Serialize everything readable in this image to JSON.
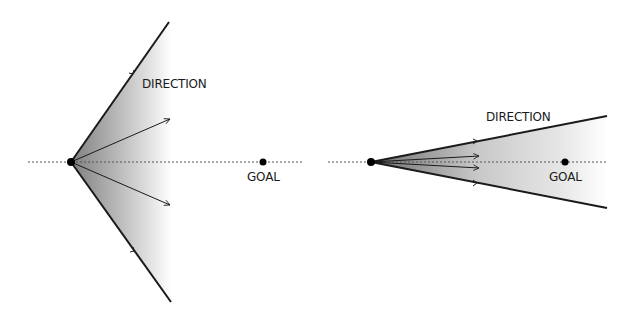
{
  "diagram": {
    "colors": {
      "line": "#1a1a1a",
      "dotted": "#555555",
      "shade_dark": "#8a8a8a",
      "shade_light": "#ffffff"
    },
    "panels": [
      {
        "id": "wide-cone",
        "origin": {
          "x": 71,
          "y": 162
        },
        "upper_end": {
          "x": 169,
          "y": 22
        },
        "lower_end": {
          "x": 171,
          "y": 302
        },
        "axis": {
          "x1": 28,
          "x2": 304,
          "y": 162
        },
        "goal": {
          "x": 263,
          "y": 162,
          "label": "GOAL",
          "label_x": 247,
          "label_y": 181
        },
        "direction_label": {
          "text": "DIRECTION",
          "x": 142,
          "y": 88
        },
        "arrows": [
          {
            "x2": 170,
            "y2": 119
          },
          {
            "x2": 170,
            "y2": 205
          }
        ],
        "edge_arrowheads": [
          {
            "x": 133,
            "y": 74
          },
          {
            "x": 134,
            "y": 251
          }
        ],
        "shade_end_x": 172
      },
      {
        "id": "narrow-cone",
        "origin": {
          "x": 371,
          "y": 162
        },
        "upper_end": {
          "x": 607,
          "y": 116
        },
        "lower_end": {
          "x": 607,
          "y": 208
        },
        "axis": {
          "x1": 328,
          "x2": 607,
          "y": 162
        },
        "goal": {
          "x": 565,
          "y": 162,
          "label": "GOAL",
          "label_x": 549,
          "label_y": 181
        },
        "direction_label": {
          "text": "DIRECTION",
          "x": 486,
          "y": 121
        },
        "arrows": [
          {
            "x2": 479,
            "y2": 156
          },
          {
            "x2": 479,
            "y2": 168
          }
        ],
        "edge_arrowheads": [
          {
            "x": 476,
            "y": 141
          },
          {
            "x": 476,
            "y": 183
          }
        ],
        "shade_end_x": 607
      }
    ]
  }
}
